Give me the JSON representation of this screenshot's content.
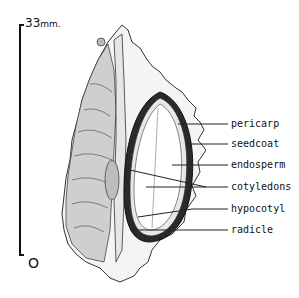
{
  "figure": {
    "scale": {
      "top_value": "33",
      "unit": "mm.",
      "bottom_value": "O"
    },
    "labels": [
      {
        "id": "pericarp",
        "text": "pericarp",
        "y": 119
      },
      {
        "id": "seedcoat",
        "text": "seedcoat",
        "y": 139
      },
      {
        "id": "endosperm",
        "text": "endosperm",
        "y": 160
      },
      {
        "id": "cotyledons",
        "text": "cotyledons",
        "y": 182
      },
      {
        "id": "hypocotyl",
        "text": "hypocotyl",
        "y": 204
      },
      {
        "id": "radicle",
        "text": "radicle",
        "y": 225
      }
    ]
  }
}
